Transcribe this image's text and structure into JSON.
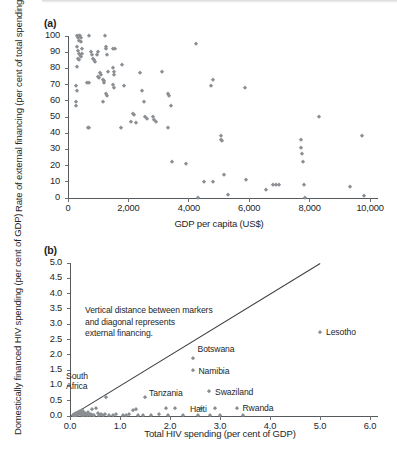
{
  "figure": {
    "panel_a_tag": "(a)",
    "panel_b_tag": "(b)"
  },
  "chart_data": [
    {
      "type": "scatter",
      "panel": "(a)",
      "title": "",
      "xlabel": "GDP per capita (US$)",
      "ylabel": "Rate of external financing (per cent of total spending)",
      "xlim": [
        0,
        10000
      ],
      "ylim": [
        0,
        100
      ],
      "xticks": [
        0,
        2000,
        4000,
        6000,
        8000,
        10000
      ],
      "xticklabels": [
        "0",
        "2,000",
        "4,000",
        "6,000",
        "8,000",
        "10,000"
      ],
      "yticks": [
        0,
        10,
        20,
        30,
        40,
        50,
        60,
        70,
        80,
        90,
        100
      ],
      "yticklabels": [
        "0",
        "10",
        "20",
        "30",
        "40",
        "50",
        "60",
        "70",
        "80",
        "90",
        "100"
      ],
      "grid": false,
      "legend": "none",
      "marker_color": "#8b8f93",
      "marker_shape": "diamond",
      "points": [
        [
          300,
          100
        ],
        [
          340,
          99
        ],
        [
          360,
          97
        ],
        [
          380,
          100
        ],
        [
          400,
          100
        ],
        [
          420,
          99
        ],
        [
          430,
          96
        ],
        [
          300,
          93
        ],
        [
          340,
          91
        ],
        [
          360,
          89
        ],
        [
          390,
          88
        ],
        [
          420,
          87
        ],
        [
          450,
          89
        ],
        [
          470,
          92
        ],
        [
          330,
          86
        ],
        [
          360,
          85
        ],
        [
          300,
          81
        ],
        [
          280,
          69
        ],
        [
          300,
          66
        ],
        [
          250,
          59
        ],
        [
          260,
          57
        ],
        [
          700,
          100
        ],
        [
          760,
          90
        ],
        [
          800,
          88
        ],
        [
          820,
          86
        ],
        [
          860,
          85
        ],
        [
          700,
          71
        ],
        [
          640,
          71
        ],
        [
          900,
          84
        ],
        [
          950,
          88
        ],
        [
          980,
          90
        ],
        [
          1000,
          75
        ],
        [
          1030,
          74
        ],
        [
          1060,
          77
        ],
        [
          1100,
          76
        ],
        [
          1150,
          73
        ],
        [
          1180,
          72
        ],
        [
          1230,
          100
        ],
        [
          1250,
          93
        ],
        [
          1270,
          92
        ],
        [
          1290,
          88
        ],
        [
          1200,
          71
        ],
        [
          1250,
          64
        ],
        [
          1300,
          63
        ],
        [
          1320,
          78
        ],
        [
          1150,
          59
        ],
        [
          1500,
          92
        ],
        [
          1560,
          92
        ],
        [
          1480,
          80
        ],
        [
          1510,
          78
        ],
        [
          1530,
          76
        ],
        [
          1500,
          70
        ],
        [
          1520,
          68
        ],
        [
          1800,
          82
        ],
        [
          1850,
          69
        ],
        [
          1750,
          43
        ],
        [
          650,
          43
        ],
        [
          700,
          43
        ],
        [
          2150,
          52
        ],
        [
          2200,
          51
        ],
        [
          2100,
          47
        ],
        [
          2250,
          46
        ],
        [
          2400,
          77
        ],
        [
          2450,
          66
        ],
        [
          2500,
          59
        ],
        [
          2550,
          50
        ],
        [
          2600,
          49
        ],
        [
          2800,
          50
        ],
        [
          2850,
          48
        ],
        [
          2900,
          47
        ],
        [
          3100,
          78
        ],
        [
          3300,
          64
        ],
        [
          3350,
          63
        ],
        [
          3400,
          57
        ],
        [
          3300,
          43
        ],
        [
          3450,
          22
        ],
        [
          3900,
          21
        ],
        [
          4250,
          95
        ],
        [
          4300,
          0
        ],
        [
          4500,
          10
        ],
        [
          4800,
          10
        ],
        [
          4750,
          69
        ],
        [
          4800,
          73
        ],
        [
          5050,
          38
        ],
        [
          5050,
          36
        ],
        [
          5100,
          35
        ],
        [
          5150,
          14
        ],
        [
          5300,
          2
        ],
        [
          5850,
          68
        ],
        [
          5900,
          11
        ],
        [
          6550,
          5
        ],
        [
          6800,
          8
        ],
        [
          6900,
          8
        ],
        [
          7000,
          8
        ],
        [
          7700,
          36
        ],
        [
          7700,
          31
        ],
        [
          7750,
          27
        ],
        [
          7780,
          22
        ],
        [
          7800,
          8
        ],
        [
          7850,
          0
        ],
        [
          8300,
          50
        ],
        [
          9350,
          7
        ],
        [
          9750,
          38
        ],
        [
          9800,
          1
        ]
      ]
    },
    {
      "type": "scatter",
      "panel": "(b)",
      "title": "",
      "xlabel": "Total HIV spending (per cent of GDP)",
      "ylabel": "Domestically financed HIV spending (per cent of GDP)",
      "xlim": [
        0,
        6.0
      ],
      "ylim": [
        0,
        5.0
      ],
      "xticks": [
        0.0,
        1.0,
        2.0,
        3.0,
        4.0,
        5.0,
        6.0
      ],
      "xticklabels": [
        "0.0",
        "1.0",
        "2.0",
        "3.0",
        "4.0",
        "5.0",
        "6.0"
      ],
      "yticks": [
        0.0,
        0.5,
        1.0,
        1.5,
        2.0,
        2.5,
        3.0,
        3.5,
        4.0,
        4.5,
        5.0
      ],
      "yticklabels": [
        "0.0",
        "0.5",
        "1.0",
        "1.5",
        "2.0",
        "2.5",
        "3.0",
        "3.5",
        "4.0",
        "4.5",
        "5.0"
      ],
      "grid": false,
      "legend": "none",
      "marker_color": "#8b8f93",
      "marker_shape": "diamond",
      "reference_line": {
        "description": "45-degree diagonal y = x",
        "from": [
          0.0,
          0.0
        ],
        "to": [
          5.0,
          5.0
        ],
        "color": "#3a3f43"
      },
      "annotation": {
        "line1": "Vertical distance between markers",
        "line2": "and diagonal represents",
        "line3": "external financing."
      },
      "labeled_points": [
        {
          "name": "Lesotho",
          "x": 5.0,
          "y": 2.75
        },
        {
          "name": "Botswana",
          "x": 2.45,
          "y": 1.9
        },
        {
          "name": "Namibia",
          "x": 2.45,
          "y": 1.5
        },
        {
          "name": "Swaziland",
          "x": 2.78,
          "y": 0.82
        },
        {
          "name": "South Africa",
          "x": 0.72,
          "y": 0.62
        },
        {
          "name": "Tanzania",
          "x": 1.5,
          "y": 0.62
        },
        {
          "name": "Haiti",
          "x": 2.8,
          "y": 0.02
        },
        {
          "name": "Rwanda",
          "x": 3.33,
          "y": 0.25
        }
      ],
      "points": [
        [
          0.05,
          0.03
        ],
        [
          0.07,
          0.05
        ],
        [
          0.08,
          0.02
        ],
        [
          0.09,
          0.07
        ],
        [
          0.1,
          0.04
        ],
        [
          0.11,
          0.09
        ],
        [
          0.12,
          0.06
        ],
        [
          0.13,
          0.11
        ],
        [
          0.14,
          0.03
        ],
        [
          0.15,
          0.12
        ],
        [
          0.16,
          0.08
        ],
        [
          0.17,
          0.14
        ],
        [
          0.18,
          0.05
        ],
        [
          0.19,
          0.1
        ],
        [
          0.2,
          0.16
        ],
        [
          0.21,
          0.07
        ],
        [
          0.22,
          0.12
        ],
        [
          0.23,
          0.18
        ],
        [
          0.24,
          0.04
        ],
        [
          0.25,
          0.09
        ],
        [
          0.26,
          0.15
        ],
        [
          0.28,
          0.02
        ],
        [
          0.3,
          0.11
        ],
        [
          0.32,
          0.06
        ],
        [
          0.34,
          0.03
        ],
        [
          0.36,
          0.13
        ],
        [
          0.38,
          0.05
        ],
        [
          0.4,
          0.02
        ],
        [
          0.42,
          0.08
        ],
        [
          0.44,
          0.24
        ],
        [
          0.46,
          0.04
        ],
        [
          0.48,
          0.02
        ],
        [
          0.52,
          0.25
        ],
        [
          0.55,
          0.09
        ],
        [
          0.58,
          0.03
        ],
        [
          0.62,
          0.05
        ],
        [
          0.66,
          0.02
        ],
        [
          0.7,
          0.07
        ],
        [
          0.72,
          0.62
        ],
        [
          0.78,
          0.04
        ],
        [
          0.85,
          0.02
        ],
        [
          0.92,
          0.05
        ],
        [
          1.05,
          0.03
        ],
        [
          1.12,
          0.02
        ],
        [
          1.18,
          0.08
        ],
        [
          1.25,
          0.19
        ],
        [
          1.32,
          0.24
        ],
        [
          1.36,
          0.02
        ],
        [
          1.45,
          0.04
        ],
        [
          1.5,
          0.62
        ],
        [
          1.62,
          0.02
        ],
        [
          1.78,
          0.05
        ],
        [
          1.92,
          0.25
        ],
        [
          1.95,
          0.03
        ],
        [
          2.1,
          0.26
        ],
        [
          2.25,
          0.02
        ],
        [
          2.45,
          1.9
        ],
        [
          2.45,
          1.5
        ],
        [
          2.55,
          0.04
        ],
        [
          2.62,
          0.26
        ],
        [
          2.78,
          0.82
        ],
        [
          2.8,
          0.02
        ],
        [
          2.9,
          0.25
        ],
        [
          3.0,
          0.03
        ],
        [
          3.33,
          0.25
        ],
        [
          3.45,
          0.02
        ],
        [
          5.0,
          2.75
        ]
      ]
    }
  ]
}
